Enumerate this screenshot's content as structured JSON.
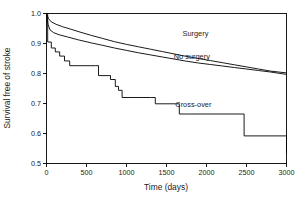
{
  "chart_data": {
    "type": "line",
    "title": "",
    "xlabel": "Time (days)",
    "ylabel": "Survival free of stroke",
    "xlim": [
      0,
      3000
    ],
    "ylim": [
      0.5,
      1.0
    ],
    "xticks": [
      0,
      500,
      1000,
      1500,
      2000,
      2500,
      3000
    ],
    "xtick_labels": [
      "0",
      "500",
      "1000",
      "1500",
      "2000",
      "2500",
      "3000"
    ],
    "yticks": [
      0.5,
      0.6,
      0.7,
      0.8,
      0.9,
      1.0
    ],
    "ytick_labels": [
      "0.5",
      "0.6",
      "0.7",
      "0.8",
      "0.9",
      "1.0"
    ],
    "grid": false,
    "legend_position": "inline-annotations",
    "line_color": "#000000",
    "series": [
      {
        "name": "Surgery",
        "style": "kaplan-meier-smooth",
        "label_x": 1700,
        "label_y": 0.925,
        "x": [
          0,
          25,
          60,
          120,
          200,
          300,
          420,
          560,
          700,
          850,
          1000,
          1150,
          1300,
          1450,
          1600,
          1750,
          1900,
          2050,
          2200,
          2350,
          2500,
          2650,
          2800,
          3000
        ],
        "y": [
          1.0,
          0.983,
          0.972,
          0.964,
          0.956,
          0.948,
          0.938,
          0.927,
          0.917,
          0.906,
          0.897,
          0.889,
          0.881,
          0.873,
          0.865,
          0.857,
          0.85,
          0.843,
          0.836,
          0.829,
          0.822,
          0.815,
          0.808,
          0.802
        ]
      },
      {
        "name": "No surgery",
        "style": "kaplan-meier-smooth",
        "label_x": 1590,
        "label_y": 0.848,
        "x": [
          0,
          20,
          45,
          90,
          160,
          260,
          400,
          560,
          700,
          850,
          1000,
          1150,
          1300,
          1450,
          1600,
          1750,
          1900,
          2050,
          2200,
          2350,
          2500,
          2650,
          2800,
          3000
        ],
        "y": [
          1.0,
          0.963,
          0.945,
          0.936,
          0.929,
          0.922,
          0.912,
          0.902,
          0.894,
          0.885,
          0.877,
          0.869,
          0.862,
          0.855,
          0.848,
          0.841,
          0.835,
          0.83,
          0.825,
          0.82,
          0.815,
          0.81,
          0.805,
          0.797
        ]
      },
      {
        "name": "Cross-over",
        "style": "kaplan-meier-step",
        "label_x": 1610,
        "label_y": 0.687,
        "x": [
          0,
          15,
          60,
          110,
          165,
          225,
          290,
          610,
          650,
          800,
          860,
          900,
          945,
          1300,
          1360,
          1610,
          1660,
          1745,
          2470,
          3000
        ],
        "y": [
          1.0,
          0.905,
          0.885,
          0.872,
          0.858,
          0.842,
          0.826,
          0.826,
          0.793,
          0.78,
          0.757,
          0.744,
          0.72,
          0.72,
          0.699,
          0.699,
          0.665,
          0.665,
          0.592,
          0.534
        ]
      }
    ]
  },
  "axis": {
    "x_title": "Time (days)",
    "y_title": "Survival free of stroke"
  }
}
